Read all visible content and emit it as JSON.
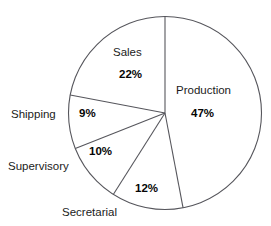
{
  "figure": {
    "title_remnant": "",
    "background_color": "#ffffff",
    "stroke_color": "#56565c"
  },
  "chart_data": {
    "type": "pie",
    "title": "",
    "subtitle": "",
    "xlabel": "",
    "ylabel": "",
    "grid": false,
    "legend_position": "none",
    "units": "percent",
    "total": 100,
    "start_angle_deg": 0,
    "direction": "clockwise",
    "categories": [
      "Production",
      "Secretarial",
      "Supervisory",
      "Shipping",
      "Sales"
    ],
    "values": [
      47,
      12,
      10,
      9,
      22
    ],
    "slices": [
      {
        "name": "Production",
        "label": "Production",
        "value": 47,
        "value_label": "47%",
        "start_deg": 0,
        "end_deg": 169.2,
        "label_placement": "inside",
        "value_placement": "inside"
      },
      {
        "name": "Secretarial",
        "label": "Secretarial",
        "value": 12,
        "value_label": "12%",
        "start_deg": 169.2,
        "end_deg": 212.4,
        "label_placement": "outside",
        "value_placement": "inside"
      },
      {
        "name": "Supervisory",
        "label": "Supervisory",
        "value": 10,
        "value_label": "10%",
        "start_deg": 212.4,
        "end_deg": 248.4,
        "label_placement": "outside",
        "value_placement": "inside"
      },
      {
        "name": "Shipping",
        "label": "Shipping",
        "value": 9,
        "value_label": "9%",
        "start_deg": 248.4,
        "end_deg": 280.8,
        "label_placement": "outside",
        "value_placement": "inside"
      },
      {
        "name": "Sales",
        "label": "Sales",
        "value": 22,
        "value_label": "22%",
        "start_deg": 280.8,
        "end_deg": 360,
        "label_placement": "inside",
        "value_placement": "inside"
      }
    ]
  }
}
